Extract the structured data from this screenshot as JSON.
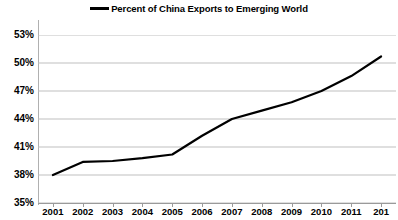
{
  "chart_data": {
    "type": "line",
    "title": "",
    "xlabel": "",
    "ylabel": "",
    "legend": [
      "Percent of China Exports to Emerging World"
    ],
    "legend_position": "top-center",
    "grid": true,
    "grid_axis": "y",
    "categories": [
      "2001",
      "2002",
      "2003",
      "2004",
      "2005",
      "2006",
      "2007",
      "2008",
      "2009",
      "2010",
      "2011",
      "2012"
    ],
    "x_tick_labels": [
      "2001",
      "2002",
      "2003",
      "2004",
      "2005",
      "2006",
      "2007",
      "2008",
      "2009",
      "2010",
      "2011",
      "201"
    ],
    "y_tick_labels": [
      "35%",
      "38%",
      "41%",
      "44%",
      "47%",
      "50%",
      "53%"
    ],
    "y_tick_values": [
      35,
      38,
      41,
      44,
      47,
      50,
      53
    ],
    "ylim": [
      35,
      53
    ],
    "series": [
      {
        "name": "Percent of China Exports to Emerging World",
        "color": "#000000",
        "values": [
          38.0,
          39.4,
          39.5,
          39.8,
          40.2,
          42.2,
          44.0,
          44.9,
          45.8,
          47.0,
          48.6,
          50.7
        ]
      }
    ]
  },
  "legend": {
    "entries": [
      {
        "label": "Percent of China Exports to Emerging World",
        "color": "#000000"
      }
    ]
  },
  "colors": {
    "series_line": "#000000",
    "gridline": "#bfbfbf",
    "axis": "#9a9a9a",
    "background": "#ffffff",
    "tick_text": "#000000"
  }
}
